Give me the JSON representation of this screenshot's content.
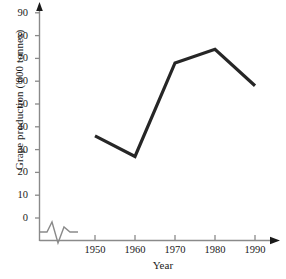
{
  "chart_data": {
    "type": "line",
    "title": "",
    "xlabel": "Year",
    "ylabel": "Grape production ('000 tonnes)",
    "x": [
      1950,
      1960,
      1970,
      1980,
      1990
    ],
    "categories": [
      "1950",
      "1960",
      "1970",
      "1980",
      "1990"
    ],
    "values": [
      36,
      27,
      68,
      74,
      58
    ],
    "series": [
      {
        "name": "Grape production",
        "values": [
          36,
          27,
          68,
          74,
          58
        ]
      }
    ],
    "xlim": [
      1950,
      1990
    ],
    "ylim": [
      0,
      90
    ],
    "ytick_labels": [
      "0",
      "10",
      "20",
      "30",
      "40",
      "50",
      "60",
      "70",
      "80",
      "90"
    ],
    "ytick_values": [
      0,
      10,
      20,
      30,
      40,
      50,
      60,
      70,
      80,
      90
    ],
    "xtick_labels": [
      "1950",
      "1960",
      "1970",
      "1980",
      "1990"
    ],
    "xtick_values": [
      1950,
      1960,
      1970,
      1980,
      1990
    ],
    "grid": false,
    "legend": false,
    "legend_position": "none",
    "axis_break": true,
    "axis_break_note": "zigzag break on x-axis between origin and 1950",
    "line_color": "#262626",
    "axis_color": "#808080",
    "markers": false
  },
  "axes": {
    "y_title": "Grape production ('000 tonnes)",
    "x_title": "Year"
  },
  "icons": {
    "y_arrow": "arrow-up-icon",
    "x_arrow": "arrow-right-icon",
    "break": "axis-break-zigzag-icon"
  },
  "caption": {
    "text": ""
  }
}
